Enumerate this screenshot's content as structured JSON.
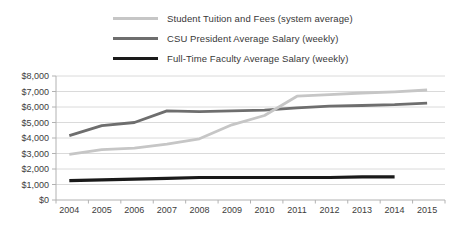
{
  "legend": {
    "items": [
      {
        "label": "Student Tuition and Fees (system average)",
        "color": "#c6c6c6"
      },
      {
        "label": "CSU President Average Salary (weekly)",
        "color": "#6e6e6e"
      },
      {
        "label": "Full-Time Faculty Average Salary (weekly)",
        "color": "#1a1a1a"
      }
    ]
  },
  "chart_data": {
    "type": "line",
    "title": "",
    "xlabel": "",
    "ylabel": "",
    "categories": [
      "2004",
      "2005",
      "2006",
      "2007",
      "2008",
      "2009",
      "2010",
      "2011",
      "2012",
      "2013",
      "2014",
      "2015"
    ],
    "series": [
      {
        "name": "Student Tuition and Fees (system average)",
        "color": "#c6c6c6",
        "values": [
          2950,
          3250,
          3350,
          3600,
          3950,
          4850,
          5450,
          6700,
          6800,
          6900,
          6980,
          7100
        ]
      },
      {
        "name": "CSU President Average Salary (weekly)",
        "color": "#6e6e6e",
        "values": [
          4150,
          4800,
          5000,
          5750,
          5700,
          5750,
          5800,
          5950,
          6050,
          6100,
          6150,
          6250
        ]
      },
      {
        "name": "Full-Time Faculty Average Salary (weekly)",
        "color": "#1a1a1a",
        "values": [
          1250,
          1300,
          1350,
          1400,
          1450,
          1450,
          1450,
          1450,
          1450,
          1500,
          1500,
          null
        ]
      }
    ],
    "ylim": [
      0,
      8000
    ],
    "y_tick_step": 1000,
    "y_tick_labels": [
      "$0",
      "$1,000",
      "$2,000",
      "$3,000",
      "$4,000",
      "$5,000",
      "$6,000",
      "$7,000",
      "$8,000"
    ],
    "grid": true,
    "legend_position": "top"
  }
}
